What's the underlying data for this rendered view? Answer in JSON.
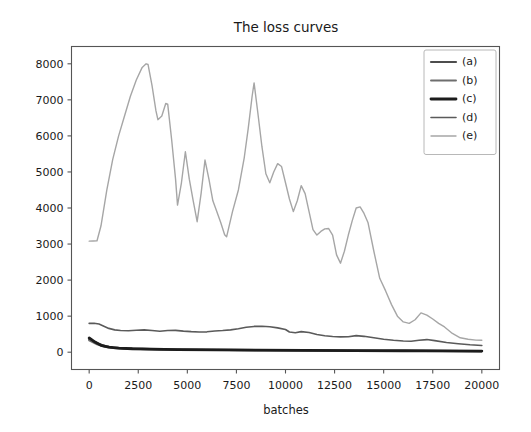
{
  "chart_data": {
    "type": "line",
    "title": "The loss curves",
    "xlabel": "batches",
    "ylabel": "",
    "xlim": [
      -900,
      20900
    ],
    "ylim": [
      -480,
      8480
    ],
    "grid": false,
    "legend_position": "upper right",
    "xticks": [
      0,
      2500,
      5000,
      7500,
      10000,
      12500,
      15000,
      17500,
      20000
    ],
    "xtick_labels": [
      "0",
      "2500",
      "5000",
      "7500",
      "10000",
      "12500",
      "15000",
      "17500",
      "20000"
    ],
    "yticks": [
      0,
      1000,
      2000,
      3000,
      4000,
      5000,
      6000,
      7000,
      8000
    ],
    "ytick_labels": [
      "0",
      "1000",
      "2000",
      "3000",
      "4000",
      "5000",
      "6000",
      "7000",
      "8000"
    ],
    "series": [
      {
        "name": "(a)",
        "color": "#4d4d4d",
        "width": 2.2,
        "x": [
          0,
          400,
          800,
          1200,
          1800,
          2600,
          3600,
          5000,
          7000,
          9000,
          11000,
          13000,
          15000,
          17000,
          19000,
          20000
        ],
        "values": [
          360,
          250,
          170,
          130,
          105,
          90,
          80,
          70,
          62,
          55,
          50,
          45,
          40,
          36,
          32,
          30
        ]
      },
      {
        "name": "(b)",
        "color": "#6e6e6e",
        "width": 1.9,
        "x": [
          0,
          400,
          800,
          1200,
          1800,
          2600,
          3600,
          5000,
          7000,
          9000,
          11000,
          13000,
          15000,
          17000,
          19000,
          20000
        ],
        "values": [
          330,
          215,
          150,
          118,
          96,
          84,
          74,
          66,
          58,
          52,
          47,
          43,
          38,
          34,
          30,
          28
        ]
      },
      {
        "name": "(c)",
        "color": "#1c1c1c",
        "width": 2.8,
        "x": [
          0,
          300,
          600,
          1000,
          1500,
          2200,
          3200,
          4500,
          6500,
          8500,
          11000,
          13500,
          16000,
          18000,
          20000
        ],
        "values": [
          395,
          280,
          190,
          140,
          112,
          95,
          84,
          74,
          66,
          58,
          52,
          46,
          40,
          35,
          32
        ]
      },
      {
        "name": "(d)",
        "color": "#5a5a5a",
        "width": 1.6,
        "x": [
          0,
          250,
          500,
          750,
          1000,
          1300,
          1600,
          2000,
          2400,
          2800,
          3200,
          3600,
          4000,
          4400,
          4800,
          5200,
          5600,
          6000,
          6400,
          6800,
          7200,
          7600,
          8000,
          8400,
          8800,
          9200,
          9600,
          10000,
          10200,
          10500,
          10800,
          11200,
          11600,
          12000,
          12400,
          12800,
          13200,
          13600,
          14000,
          14500,
          15000,
          15500,
          16000,
          16400,
          16800,
          17200,
          17600,
          18200,
          18800,
          19400,
          20000
        ],
        "values": [
          800,
          805,
          780,
          720,
          660,
          620,
          600,
          595,
          610,
          620,
          600,
          580,
          600,
          605,
          585,
          570,
          560,
          565,
          590,
          600,
          620,
          650,
          690,
          715,
          720,
          705,
          675,
          630,
          560,
          540,
          570,
          545,
          490,
          455,
          435,
          425,
          430,
          460,
          440,
          400,
          360,
          330,
          310,
          305,
          330,
          350,
          320,
          270,
          235,
          205,
          185
        ]
      },
      {
        "name": "(e)",
        "color": "#a6a6a6",
        "width": 1.4,
        "x": [
          0,
          200,
          400,
          600,
          900,
          1200,
          1500,
          1800,
          2100,
          2400,
          2700,
          2900,
          3000,
          3200,
          3400,
          3500,
          3700,
          3900,
          4000,
          4200,
          4400,
          4500,
          4700,
          4900,
          5100,
          5300,
          5500,
          5700,
          5900,
          6100,
          6300,
          6500,
          6700,
          6900,
          7000,
          7300,
          7600,
          7900,
          8100,
          8300,
          8400,
          8600,
          8800,
          9000,
          9200,
          9400,
          9600,
          9800,
          10000,
          10200,
          10400,
          10600,
          10800,
          11000,
          11200,
          11400,
          11600,
          11800,
          12000,
          12200,
          12400,
          12600,
          12800,
          13000,
          13200,
          13400,
          13600,
          13800,
          14000,
          14200,
          14500,
          14800,
          15100,
          15400,
          15700,
          16000,
          16300,
          16600,
          16900,
          17200,
          17500,
          17800,
          18100,
          18500,
          18900,
          19300,
          19700,
          20000
        ],
        "values": [
          3080,
          3085,
          3090,
          3500,
          4500,
          5350,
          6000,
          6550,
          7100,
          7550,
          7900,
          8000,
          7980,
          7400,
          6700,
          6450,
          6550,
          6900,
          6880,
          5900,
          4800,
          4080,
          4700,
          5560,
          4800,
          4200,
          3620,
          4400,
          5330,
          4800,
          4200,
          3900,
          3600,
          3260,
          3200,
          3900,
          4500,
          5400,
          6200,
          7100,
          7470,
          6600,
          5700,
          4950,
          4700,
          5000,
          5230,
          5150,
          4700,
          4250,
          3900,
          4200,
          4620,
          4400,
          3900,
          3400,
          3250,
          3350,
          3420,
          3430,
          3250,
          2700,
          2470,
          2800,
          3250,
          3650,
          4000,
          4030,
          3850,
          3600,
          2800,
          2050,
          1700,
          1320,
          1000,
          840,
          800,
          900,
          1090,
          1030,
          920,
          800,
          700,
          520,
          400,
          360,
          335,
          330
        ]
      }
    ]
  },
  "legend": {
    "entries": [
      {
        "label": "(a)"
      },
      {
        "label": "(b)"
      },
      {
        "label": "(c)"
      },
      {
        "label": "(d)"
      },
      {
        "label": "(e)"
      }
    ]
  }
}
